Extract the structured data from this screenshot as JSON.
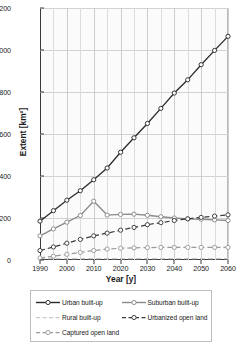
{
  "chart_data": {
    "type": "line",
    "title": "",
    "xlabel": "Year [y]",
    "ylabel": "Extent [km²]",
    "xlim": [
      1990,
      2060
    ],
    "ylim": [
      0,
      1200
    ],
    "xticks": [
      1990,
      2000,
      2010,
      2020,
      2030,
      2040,
      2050,
      2060
    ],
    "yticks": [
      0,
      200,
      400,
      600,
      800,
      1000,
      1200
    ],
    "x_minor_step": 5,
    "grid": true,
    "legend_position": "below",
    "x": [
      1990,
      1995,
      2000,
      2005,
      2010,
      2015,
      2020,
      2025,
      2030,
      2035,
      2040,
      2045,
      2050,
      2055,
      2060
    ],
    "series": [
      {
        "name": "Urban built-up",
        "color": "#2b2b2b",
        "style": "solid",
        "marker": "open-circle",
        "values": [
          185,
          235,
          285,
          330,
          382,
          438,
          513,
          582,
          650,
          722,
          795,
          858,
          930,
          998,
          1065
        ]
      },
      {
        "name": "Suburban built-up",
        "color": "#8a8a8a",
        "style": "solid",
        "marker": "open-circle",
        "values": [
          115,
          148,
          180,
          212,
          280,
          214,
          217,
          218,
          213,
          206,
          200,
          196,
          194,
          191,
          188
        ]
      },
      {
        "name": "Rural built-up",
        "color": "#c9c9c9",
        "style": "dashed",
        "marker": "none",
        "values": [
          6,
          6,
          6,
          6,
          6,
          6,
          6,
          6,
          6,
          6,
          6,
          6,
          6,
          6,
          6
        ]
      },
      {
        "name": "Urbanized open land",
        "color": "#3a3a3a",
        "style": "dashed",
        "marker": "open-circle",
        "values": [
          45,
          62,
          80,
          98,
          115,
          128,
          142,
          155,
          168,
          178,
          188,
          196,
          203,
          209,
          215
        ]
      },
      {
        "name": "Captured open land",
        "color": "#9a9a9a",
        "style": "dashed",
        "marker": "open-circle",
        "values": [
          10,
          18,
          27,
          36,
          45,
          52,
          56,
          58,
          59,
          60,
          60,
          60,
          60,
          60,
          60
        ]
      }
    ]
  },
  "legend": {
    "entries": [
      {
        "label": "Urban built-up"
      },
      {
        "label": "Suburban built-up"
      },
      {
        "label": "Rural built-up"
      },
      {
        "label": "Urbanized open land"
      },
      {
        "label": "Captured open land"
      }
    ]
  },
  "caption": {
    "text": ""
  }
}
